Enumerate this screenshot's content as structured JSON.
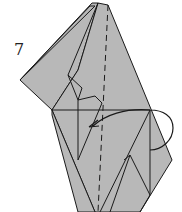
{
  "diagram": {
    "step_number": "7",
    "paper_color": "#b8b8b8",
    "line_color": "#1a1a1a",
    "elements": [
      "folded-paper-model",
      "valley-fold-dashed-line",
      "fold-arrow",
      "step-number"
    ]
  }
}
